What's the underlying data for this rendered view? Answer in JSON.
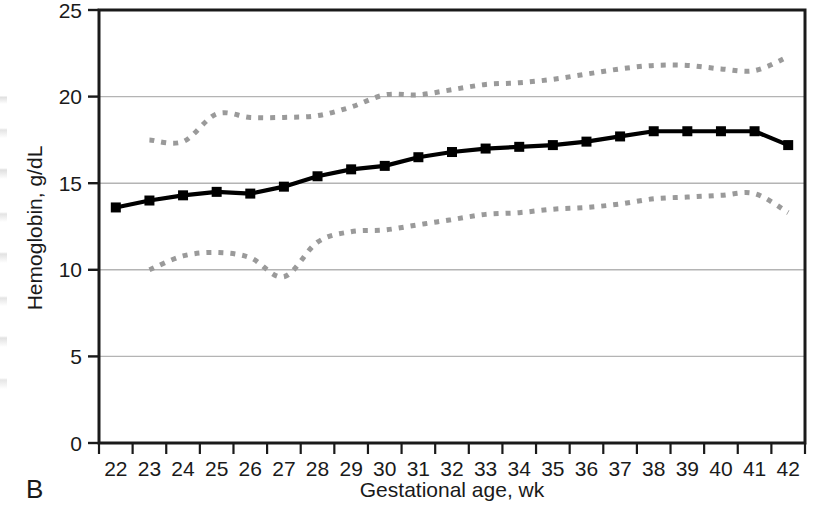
{
  "panel_label": "B",
  "colors": {
    "series_line": "#000000",
    "band_line": "#9a9a9a",
    "gridline": "#b4b4b4",
    "axis": "#1a1a1a",
    "background": "#ffffff"
  },
  "chart_data": {
    "type": "line",
    "title": "",
    "subtitle": "",
    "xlabel": "Gestational age, wk",
    "ylabel": "Hemoglobin, g/dL",
    "xlim": [
      21.5,
      42.5
    ],
    "ylim": [
      0,
      25
    ],
    "yticks": [
      0,
      5,
      10,
      15,
      20,
      25
    ],
    "ytick_labels": [
      "0",
      "5",
      "10",
      "15",
      "20",
      "25"
    ],
    "grid": "horizontal",
    "legend": "none",
    "x": [
      22,
      23,
      24,
      25,
      26,
      27,
      28,
      29,
      30,
      31,
      32,
      33,
      34,
      35,
      36,
      37,
      38,
      39,
      40,
      41,
      42
    ],
    "xtick_labels": [
      "22",
      "23",
      "24",
      "25",
      "26",
      "27",
      "28",
      "29",
      "30",
      "31",
      "32",
      "33",
      "34",
      "35",
      "36",
      "37",
      "38",
      "39",
      "40",
      "41",
      "42"
    ],
    "series": [
      {
        "name": "Mean hemoglobin",
        "style": "solid",
        "marker": "square",
        "color": "#000000",
        "x": [
          22,
          23,
          24,
          25,
          26,
          27,
          28,
          29,
          30,
          31,
          32,
          33,
          34,
          35,
          36,
          37,
          38,
          39,
          40,
          41,
          42
        ],
        "values": [
          13.6,
          14.0,
          14.3,
          14.5,
          14.4,
          14.8,
          15.4,
          15.8,
          16.0,
          16.5,
          16.8,
          17.0,
          17.1,
          17.2,
          17.4,
          17.7,
          18.0,
          18.0,
          18.0,
          18.0,
          17.2
        ]
      },
      {
        "name": "Upper percentile band",
        "style": "dotted",
        "marker": "none",
        "color": "#9a9a9a",
        "x": [
          23,
          24,
          25,
          26,
          27,
          28,
          29,
          30,
          31,
          32,
          33,
          34,
          35,
          36,
          37,
          38,
          39,
          40,
          41,
          42
        ],
        "values": [
          17.5,
          17.4,
          19.0,
          18.8,
          18.8,
          18.9,
          19.4,
          20.1,
          20.1,
          20.4,
          20.7,
          20.8,
          21.0,
          21.3,
          21.6,
          21.8,
          21.8,
          21.6,
          21.5,
          22.3
        ]
      },
      {
        "name": "Lower percentile band",
        "style": "dotted",
        "marker": "none",
        "color": "#9a9a9a",
        "x": [
          23,
          24,
          25,
          26,
          27,
          28,
          29,
          30,
          31,
          32,
          33,
          34,
          35,
          36,
          37,
          38,
          39,
          40,
          41,
          42
        ],
        "values": [
          10.0,
          10.8,
          11.0,
          10.7,
          9.6,
          11.6,
          12.2,
          12.3,
          12.6,
          12.9,
          13.2,
          13.3,
          13.5,
          13.6,
          13.8,
          14.1,
          14.2,
          14.3,
          14.4,
          13.3
        ]
      }
    ]
  }
}
